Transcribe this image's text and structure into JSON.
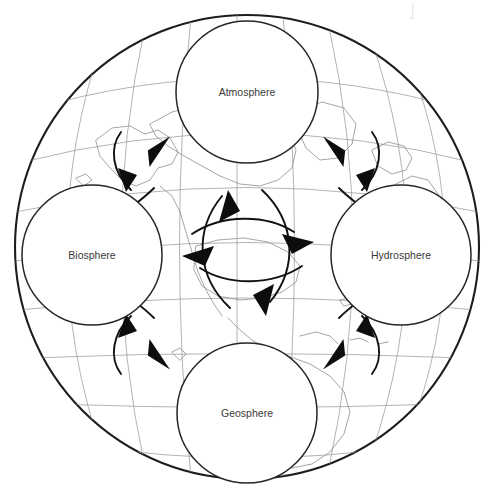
{
  "figure": {
    "background_image": "globe-with-graticule-and-continents",
    "outer_shape": "globe-outline"
  },
  "spheres": [
    {
      "id": "atmosphere",
      "label": "Atmosphere",
      "position": "top",
      "cx": 247,
      "cy": 92,
      "r": 71
    },
    {
      "id": "biosphere",
      "label": "Biosphere",
      "position": "left",
      "cx": 92,
      "cy": 255,
      "r": 70
    },
    {
      "id": "hydrosphere",
      "label": "Hydrosphere",
      "position": "right",
      "cx": 401,
      "cy": 255,
      "r": 70
    },
    {
      "id": "geosphere",
      "label": "Geosphere",
      "position": "bottom",
      "cx": 247,
      "cy": 413,
      "r": 70
    }
  ],
  "connections": [
    {
      "id": "biosphere-atmosphere",
      "from": "Biosphere",
      "to": "Atmosphere",
      "style": "double-headed-curved-pair",
      "location": "upper-left"
    },
    {
      "id": "atmosphere-hydrosphere",
      "from": "Atmosphere",
      "to": "Hydrosphere",
      "style": "double-headed-curved-pair",
      "location": "upper-right"
    },
    {
      "id": "biosphere-geosphere",
      "from": "Biosphere",
      "to": "Geosphere",
      "style": "double-headed-curved-pair",
      "location": "lower-left"
    },
    {
      "id": "geosphere-hydrosphere",
      "from": "Geosphere",
      "to": "Hydrosphere",
      "style": "double-headed-curved-pair",
      "location": "lower-right"
    },
    {
      "id": "vertical-center",
      "from": "Atmosphere",
      "to": "Geosphere",
      "style": "double-headed-lens",
      "location": "center"
    },
    {
      "id": "horizontal-center",
      "from": "Biosphere",
      "to": "Hydrosphere",
      "style": "double-headed-lens",
      "location": "center"
    }
  ],
  "caption": {
    "label": "",
    "text": ""
  },
  "colors": {
    "globe_outline": "#1d1d1d",
    "graticule": "#9a9a9a",
    "coastline": "#8e8e8e",
    "sphere_outline": "#262626",
    "arrow": "#0d0d0d",
    "label_text": "#3a3a3a",
    "background": "#ffffff"
  }
}
